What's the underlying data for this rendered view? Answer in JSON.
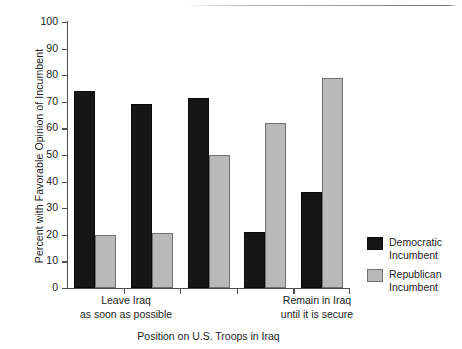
{
  "chart_data": {
    "type": "bar",
    "title": "",
    "xlabel": "Position on U.S. Troops in Iraq",
    "ylabel": "Percent with Favorable Opinion of Incumbent",
    "ylim": [
      0,
      100
    ],
    "yticks": [
      0,
      10,
      20,
      30,
      40,
      50,
      60,
      70,
      80,
      90,
      100
    ],
    "grid": false,
    "legend_position": "right",
    "categories": [
      "1",
      "2",
      "3",
      "4",
      "5"
    ],
    "category_axis_labels": {
      "left": [
        "Leave Iraq",
        "as soon as possible"
      ],
      "right": [
        "Remain in Iraq",
        "until it is secure"
      ]
    },
    "series": [
      {
        "name": "Democratic Incumbent",
        "color": "#161616",
        "values": [
          74,
          69,
          71.5,
          21,
          36
        ]
      },
      {
        "name": "Republican Incumbent",
        "color": "#b9b9b9",
        "values": [
          20,
          20.5,
          50,
          62,
          79
        ]
      }
    ]
  },
  "axis": {
    "y_tick_labels": [
      "100",
      "90",
      "80",
      "70",
      "60",
      "50",
      "40",
      "30",
      "20",
      "10",
      "0"
    ],
    "y_title": "Percent with Favorable Opinion of Incumbent",
    "x_title": "Position on U.S. Troops in Iraq"
  },
  "categories_text": {
    "left_line1": "Leave Iraq",
    "left_line2": "as soon as possible",
    "right_line1": "Remain in Iraq",
    "right_line2": "until it is secure"
  },
  "legend": {
    "items": [
      {
        "line1": "Democratic",
        "line2": "Incumbent",
        "color": "#161616"
      },
      {
        "line1": "Republican",
        "line2": "Incumbent",
        "color": "#b9b9b9"
      }
    ]
  }
}
